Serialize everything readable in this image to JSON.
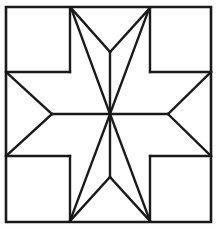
{
  "figure": {
    "kind": "line-drawing",
    "canvas": {
      "width": 216,
      "height": 229
    },
    "background_color": "#fefefe",
    "line_color": "#1a1a1a",
    "patch_fill_color": "#ffffff",
    "outer_line_width": 2.6,
    "inner_line_width": 2.4
  },
  "geometry": {
    "block_border": {
      "name": "outer-square-border",
      "left": 6,
      "top": 7,
      "right": 211,
      "bottom": 222,
      "points": "6,7 211,7 211,222 6,222"
    },
    "center": {
      "x": 110,
      "y": 114
    },
    "star_tips": [
      {
        "name": "tip-north",
        "x": 110,
        "y": 52
      },
      {
        "name": "tip-northeast",
        "x": 149,
        "y": 9
      },
      {
        "name": "tip-east",
        "x": 168,
        "y": 114
      },
      {
        "name": "tip-southeast",
        "x": 150,
        "y": 221
      },
      {
        "name": "tip-south",
        "x": 110,
        "y": 177
      },
      {
        "name": "tip-southwest",
        "x": 70,
        "y": 221
      },
      {
        "name": "tip-west",
        "x": 52,
        "y": 114
      },
      {
        "name": "tip-northwest",
        "x": 71,
        "y": 8
      }
    ],
    "inner_grid_nodes": [
      {
        "name": "node-top-left",
        "x": 71,
        "y": 8
      },
      {
        "name": "node-top-right",
        "x": 149,
        "y": 9
      },
      {
        "name": "node-left-top",
        "x": 6,
        "y": 72
      },
      {
        "name": "node-mid-left-top",
        "x": 70,
        "y": 72
      },
      {
        "name": "node-mid-right-top",
        "x": 150,
        "y": 72
      },
      {
        "name": "node-right-top",
        "x": 211,
        "y": 72
      },
      {
        "name": "node-left-bottom",
        "x": 6,
        "y": 156
      },
      {
        "name": "node-mid-left-bottom",
        "x": 70,
        "y": 156
      },
      {
        "name": "node-mid-right-bottom",
        "x": 150,
        "y": 156
      },
      {
        "name": "node-right-bottom",
        "x": 211,
        "y": 156
      },
      {
        "name": "node-bottom-left",
        "x": 70,
        "y": 221
      },
      {
        "name": "node-bottom-right",
        "x": 150,
        "y": 221
      }
    ],
    "star_diamonds": [
      {
        "name": "diamond-n",
        "points": "110,114 71,8 110,52 149,9"
      },
      {
        "name": "diamond-ne",
        "points": "110,114 149,9 150,72 211,72"
      },
      {
        "name": "diamond-e",
        "points": "110,114 211,72 168,114 211,156"
      },
      {
        "name": "diamond-se",
        "points": "110,114 211,156 150,156 150,221"
      },
      {
        "name": "diamond-s",
        "points": "110,114 150,221 110,177 70,221"
      },
      {
        "name": "diamond-sw",
        "points": "110,114 70,221 70,156 6,156"
      },
      {
        "name": "diamond-w",
        "points": "110,114 6,156 52,114 6,72"
      },
      {
        "name": "diamond-nw",
        "points": "110,114 6,72 70,72 71,8"
      }
    ],
    "corner_squares": [
      {
        "name": "corner-square-top-left",
        "points": "6,7 71,8 70,72 6,72"
      },
      {
        "name": "corner-square-top-right",
        "points": "149,9 211,7 211,72 150,72"
      },
      {
        "name": "corner-square-bottom-right",
        "points": "150,156 211,156 211,222 150,221"
      },
      {
        "name": "corner-square-bottom-left",
        "points": "6,156 70,156 70,221 6,222"
      }
    ],
    "side_triangles": [
      {
        "name": "side-triangle-north",
        "points": "71,8 149,9 110,52"
      },
      {
        "name": "side-triangle-east",
        "points": "211,72 211,156 168,114"
      },
      {
        "name": "side-triangle-south",
        "points": "150,221 70,221 110,177"
      },
      {
        "name": "side-triangle-west",
        "points": "6,72 6,156 52,114"
      }
    ],
    "spokes": [
      {
        "name": "spoke-to-north",
        "x1": 110,
        "y1": 114,
        "x2": 110,
        "y2": 52
      },
      {
        "name": "spoke-to-northeast",
        "x1": 110,
        "y1": 114,
        "x2": 149,
        "y2": 9
      },
      {
        "name": "spoke-to-east",
        "x1": 110,
        "y1": 114,
        "x2": 168,
        "y2": 114
      },
      {
        "name": "spoke-to-southeast",
        "x1": 110,
        "y1": 114,
        "x2": 150,
        "y2": 221
      },
      {
        "name": "spoke-to-south",
        "x1": 110,
        "y1": 114,
        "x2": 110,
        "y2": 177
      },
      {
        "name": "spoke-to-southwest",
        "x1": 110,
        "y1": 114,
        "x2": 70,
        "y2": 221
      },
      {
        "name": "spoke-to-west",
        "x1": 110,
        "y1": 114,
        "x2": 52,
        "y2": 114
      },
      {
        "name": "spoke-to-northwest",
        "x1": 110,
        "y1": 114,
        "x2": 71,
        "y2": 8
      }
    ],
    "inner_edges": [
      {
        "name": "edge-left-upper-horizontal",
        "x1": 6,
        "y1": 72,
        "x2": 70,
        "y2": 72
      },
      {
        "name": "edge-left-lower-horizontal",
        "x1": 6,
        "y1": 156,
        "x2": 70,
        "y2": 156
      },
      {
        "name": "edge-right-upper-horizontal",
        "x1": 150,
        "y1": 72,
        "x2": 211,
        "y2": 72
      },
      {
        "name": "edge-right-lower-horizontal",
        "x1": 150,
        "y1": 156,
        "x2": 211,
        "y2": 156
      },
      {
        "name": "edge-top-left-vertical",
        "x1": 70,
        "y1": 8,
        "x2": 70,
        "y2": 72
      },
      {
        "name": "edge-top-right-vertical",
        "x1": 150,
        "y1": 9,
        "x2": 150,
        "y2": 72
      },
      {
        "name": "edge-bottom-left-vertical",
        "x1": 70,
        "y1": 156,
        "x2": 70,
        "y2": 221
      },
      {
        "name": "edge-bottom-right-vertical",
        "x1": 150,
        "y1": 156,
        "x2": 150,
        "y2": 221
      },
      {
        "name": "edge-tip-north-left",
        "x1": 110,
        "y1": 52,
        "x2": 71,
        "y2": 8
      },
      {
        "name": "edge-tip-north-right",
        "x1": 110,
        "y1": 52,
        "x2": 149,
        "y2": 9
      },
      {
        "name": "edge-tip-west-upper",
        "x1": 52,
        "y1": 114,
        "x2": 6,
        "y2": 72
      },
      {
        "name": "edge-tip-west-lower",
        "x1": 52,
        "y1": 114,
        "x2": 6,
        "y2": 156
      },
      {
        "name": "edge-tip-east-upper",
        "x1": 168,
        "y1": 114,
        "x2": 211,
        "y2": 72
      },
      {
        "name": "edge-tip-east-lower",
        "x1": 168,
        "y1": 114,
        "x2": 211,
        "y2": 156
      },
      {
        "name": "edge-tip-south-left",
        "x1": 110,
        "y1": 177,
        "x2": 70,
        "y2": 221
      },
      {
        "name": "edge-tip-south-right",
        "x1": 110,
        "y1": 177,
        "x2": 150,
        "y2": 221
      }
    ]
  }
}
